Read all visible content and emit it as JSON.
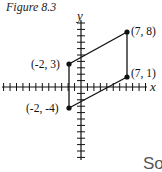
{
  "figure": {
    "title": "Figure 8.3",
    "x_axis_label": "x",
    "y_axis_label": "y",
    "trailing_text": "So"
  },
  "points": [
    {
      "label": "(7, 8)",
      "x": 7,
      "y": 8
    },
    {
      "label": "(-2, 3)",
      "x": -2,
      "y": 3
    },
    {
      "label": "(7, 1)",
      "x": 7,
      "y": 1
    },
    {
      "label": "(-2, -4)",
      "x": -2,
      "y": -4
    }
  ],
  "chart_data": {
    "type": "line",
    "title": "Figure 8.3",
    "xlabel": "x",
    "ylabel": "y",
    "shape": "parallelogram",
    "vertices": [
      [
        -2,
        3
      ],
      [
        7,
        8
      ],
      [
        7,
        1
      ],
      [
        -2,
        -4
      ]
    ],
    "segments": [
      [
        [
          -2,
          3
        ],
        [
          7,
          8
        ]
      ],
      [
        [
          7,
          8
        ],
        [
          7,
          1
        ]
      ],
      [
        [
          7,
          1
        ],
        [
          -2,
          -4
        ]
      ],
      [
        [
          -2,
          -4
        ],
        [
          -2,
          3
        ]
      ]
    ],
    "xlim": [
      -12,
      10
    ],
    "ylim": [
      -10,
      10
    ],
    "grid": false
  }
}
